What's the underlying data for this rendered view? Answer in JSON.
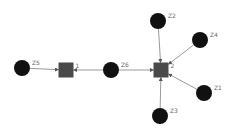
{
  "diagram": {
    "type": "network-graph",
    "colors": {
      "background": "#ffffff",
      "circle_node": "#111111",
      "square_node": "#4a4a4a",
      "edge": "#9a9a9a",
      "label": "#6a6a6a"
    },
    "nodes": [
      {
        "id": "Z5",
        "label": "Z5",
        "shape": "circle",
        "x": 22,
        "y": 68,
        "r": 8
      },
      {
        "id": "1",
        "label": "1",
        "shape": "square",
        "x": 66,
        "y": 70,
        "size": 15
      },
      {
        "id": "Z6",
        "label": "Z6",
        "shape": "circle",
        "x": 111,
        "y": 70,
        "r": 8
      },
      {
        "id": "2",
        "label": "2",
        "shape": "square",
        "x": 161,
        "y": 70,
        "size": 15
      },
      {
        "id": "Z2",
        "label": "Z2",
        "shape": "circle",
        "x": 158,
        "y": 21,
        "r": 8
      },
      {
        "id": "Z4",
        "label": "Z4",
        "shape": "circle",
        "x": 200,
        "y": 40,
        "r": 8
      },
      {
        "id": "Z1",
        "label": "Z1",
        "shape": "circle",
        "x": 204,
        "y": 93,
        "r": 8
      },
      {
        "id": "Z3",
        "label": "Z3",
        "shape": "circle",
        "x": 160,
        "y": 116,
        "r": 8
      }
    ],
    "edges": [
      {
        "from": "Z5",
        "to": "1"
      },
      {
        "from": "Z6",
        "to": "1"
      },
      {
        "from": "Z6",
        "to": "2"
      },
      {
        "from": "Z2",
        "to": "2"
      },
      {
        "from": "Z4",
        "to": "2"
      },
      {
        "from": "Z1",
        "to": "2"
      },
      {
        "from": "Z3",
        "to": "2"
      }
    ]
  }
}
